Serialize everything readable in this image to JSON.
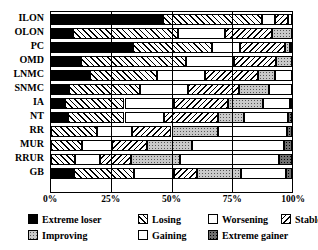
{
  "chart_data": {
    "type": "bar",
    "subtype": "stacked-horizontal-100percent",
    "title": "",
    "xlabel": "",
    "ylabel": "",
    "xlim": [
      0,
      100
    ],
    "xticks": [
      "0%",
      "25%",
      "50%",
      "75%",
      "100%"
    ],
    "xtick_values": [
      0,
      25,
      50,
      75,
      100
    ],
    "grid": true,
    "grid_axis": "x",
    "legend_position": "bottom",
    "categories": [
      "ILON",
      "OLON",
      "PC",
      "OMD",
      "LNMC",
      "SNMC",
      "IA",
      "NT",
      "RR",
      "MUR",
      "RRUR",
      "GB"
    ],
    "series": [
      {
        "name": "Extreme loser",
        "pattern": "solid-black",
        "values": [
          46.5,
          9.0,
          34.0,
          12.5,
          16.0,
          7.5,
          6.0,
          7.0,
          0.0,
          0.0,
          0.0,
          9.5
        ]
      },
      {
        "name": "Losing",
        "pattern": "diagonal-up",
        "values": [
          41.0,
          43.5,
          33.0,
          43.5,
          28.0,
          29.5,
          24.5,
          23.5,
          19.0,
          13.0,
          10.0,
          25.0
        ]
      },
      {
        "name": "Worsening",
        "pattern": "sparse-dots",
        "values": [
          5.5,
          19.5,
          11.5,
          20.0,
          20.0,
          20.0,
          20.5,
          16.5,
          14.5,
          12.5,
          10.5,
          16.5
        ]
      },
      {
        "name": "Stable",
        "pattern": "diagonal-down",
        "values": [
          5.5,
          19.5,
          18.5,
          17.5,
          22.0,
          21.0,
          22.5,
          22.5,
          16.5,
          14.5,
          12.5,
          9.5
        ]
      },
      {
        "name": "Improving",
        "pattern": "gray-dots",
        "values": [
          0.0,
          8.5,
          2.0,
          6.5,
          7.0,
          12.5,
          14.5,
          10.5,
          19.5,
          18.5,
          20.5,
          18.5
        ]
      },
      {
        "name": "Gaining",
        "pattern": "white",
        "values": [
          1.5,
          0.0,
          1.0,
          0.0,
          7.0,
          9.5,
          11.0,
          18.5,
          28.5,
          38.0,
          41.0,
          18.5
        ]
      },
      {
        "name": "Extreme gainer",
        "pattern": "dark-gray-dots",
        "values": [
          0.0,
          0.0,
          0.0,
          0.0,
          0.0,
          0.0,
          1.0,
          1.5,
          2.0,
          3.5,
          5.5,
          2.5
        ]
      }
    ],
    "legend": [
      {
        "label": "Extreme loser",
        "key": "extreme-loser"
      },
      {
        "label": "Losing",
        "key": "losing"
      },
      {
        "label": "Worsening",
        "key": "worsening"
      },
      {
        "label": "Stable",
        "key": "stable"
      },
      {
        "label": "Improving",
        "key": "improving"
      },
      {
        "label": "Gaining",
        "key": "gaining"
      },
      {
        "label": "Extreme gainer",
        "key": "extreme-gainer"
      }
    ]
  }
}
